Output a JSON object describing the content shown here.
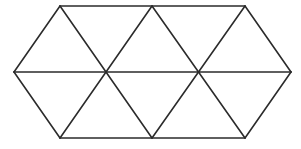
{
  "diagram": {
    "title": "",
    "stroke_color": "#2b2b2b",
    "background_color": "#ffffff",
    "stroke_width": 1.6,
    "vertices": {
      "top": [
        [
          60,
          6
        ],
        [
          152,
          6
        ],
        [
          245,
          6
        ]
      ],
      "middle": [
        [
          14,
          72
        ],
        [
          106,
          72
        ],
        [
          198,
          72
        ],
        [
          291,
          72
        ]
      ],
      "bottom": [
        [
          60,
          138
        ],
        [
          152,
          138
        ],
        [
          245,
          138
        ]
      ]
    },
    "segments": [
      [
        [
          60,
          6
        ],
        [
          245,
          6
        ]
      ],
      [
        [
          14,
          72
        ],
        [
          291,
          72
        ]
      ],
      [
        [
          60,
          138
        ],
        [
          245,
          138
        ]
      ],
      [
        [
          14,
          72
        ],
        [
          60,
          6
        ]
      ],
      [
        [
          14,
          72
        ],
        [
          60,
          138
        ]
      ],
      [
        [
          60,
          6
        ],
        [
          152,
          138
        ]
      ],
      [
        [
          60,
          138
        ],
        [
          152,
          6
        ]
      ],
      [
        [
          152,
          6
        ],
        [
          245,
          138
        ]
      ],
      [
        [
          152,
          138
        ],
        [
          245,
          6
        ]
      ],
      [
        [
          245,
          6
        ],
        [
          291,
          72
        ]
      ],
      [
        [
          245,
          138
        ],
        [
          291,
          72
        ]
      ]
    ],
    "triangle_count": 8
  }
}
